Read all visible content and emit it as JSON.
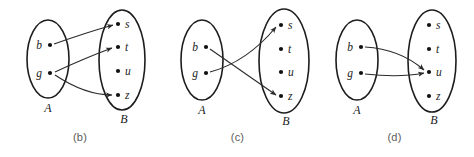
{
  "figure": {
    "background_color": "#ffffff",
    "stroke_color": "#1d1d1d",
    "caption_color": "#5a5a5a",
    "panels": [
      {
        "id": "b",
        "caption": "(b)",
        "domain": {
          "name": "A",
          "label": "A",
          "elements": [
            "b",
            "g"
          ]
        },
        "codomain": {
          "name": "B",
          "label": "B",
          "elements": [
            "s",
            "t",
            "u",
            "z"
          ]
        },
        "edges": [
          {
            "from": "b",
            "to": "s"
          },
          {
            "from": "g",
            "to": "t"
          },
          {
            "from": "g",
            "to": "z"
          }
        ]
      },
      {
        "id": "c",
        "caption": "(c)",
        "domain": {
          "name": "A",
          "label": "A",
          "elements": [
            "b",
            "g"
          ]
        },
        "codomain": {
          "name": "B",
          "label": "B",
          "elements": [
            "s",
            "t",
            "u",
            "z"
          ]
        },
        "edges": [
          {
            "from": "b",
            "to": "z"
          },
          {
            "from": "g",
            "to": "s"
          }
        ]
      },
      {
        "id": "d",
        "caption": "(d)",
        "domain": {
          "name": "A",
          "label": "A",
          "elements": [
            "b",
            "g"
          ]
        },
        "codomain": {
          "name": "B",
          "label": "B",
          "elements": [
            "s",
            "t",
            "u",
            "z"
          ]
        },
        "edges": [
          {
            "from": "b",
            "to": "u"
          },
          {
            "from": "g",
            "to": "u"
          }
        ]
      }
    ]
  }
}
